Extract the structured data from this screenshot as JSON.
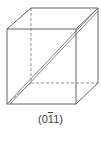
{
  "diagram": {
    "type": "cube-miller-plane",
    "caption": {
      "open": "(0",
      "barred_digit": "1",
      "close": "1)"
    },
    "colors": {
      "edge": "#555555",
      "hidden_edge": "#777777",
      "plane": "#666666"
    }
  }
}
